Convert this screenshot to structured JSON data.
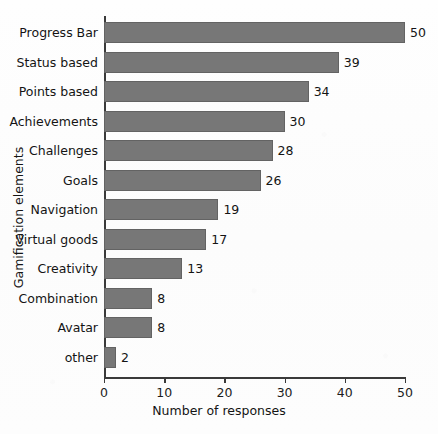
{
  "chart_data": {
    "type": "bar",
    "orientation": "horizontal",
    "title": "",
    "xlabel": "Number of responses",
    "ylabel": "Gamification elements",
    "categories": [
      "Progress Bar",
      "Status based",
      "Points based",
      "Achievements",
      "Challenges",
      "Goals",
      "Navigation",
      "Virtual goods",
      "Creativity",
      "Combination",
      "Avatar",
      "other"
    ],
    "values": [
      50,
      39,
      34,
      30,
      28,
      26,
      19,
      17,
      13,
      8,
      8,
      2
    ],
    "data_labels": [
      "50",
      "39",
      "34",
      "30",
      "28",
      "26",
      "19",
      "17",
      "13",
      "8",
      "8",
      "2"
    ],
    "xlim": [
      0,
      50
    ],
    "xticks": [
      0,
      10,
      20,
      30,
      40,
      50
    ],
    "xtick_labels": [
      "0",
      "10",
      "20",
      "30",
      "40",
      "50"
    ],
    "grid": false,
    "legend": false,
    "bar_color": "#777777",
    "bar_edge_color": "#636363",
    "axis_color": "#3a3a3a",
    "text_color": "#141414",
    "background_color": "#fdfdfd"
  }
}
